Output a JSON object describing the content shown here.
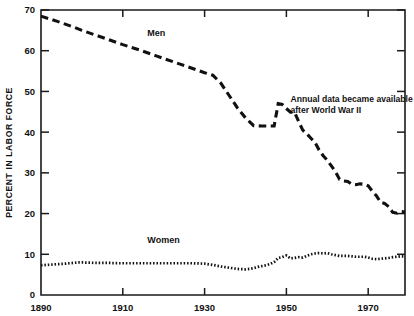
{
  "chart_data": {
    "type": "line",
    "title": "",
    "xlabel": "",
    "ylabel": "PERCENT IN LABOR FORCE",
    "xlim": [
      1890,
      1979
    ],
    "ylim": [
      0,
      70
    ],
    "grid": false,
    "legend_position": "inline-labels",
    "x_ticks": [
      1890,
      1910,
      1930,
      1950,
      1970
    ],
    "x_tick_labels": [
      "1890",
      "1910",
      "1930",
      "1950",
      "1970"
    ],
    "y_ticks": [
      0,
      10,
      20,
      30,
      40,
      50,
      60,
      70
    ],
    "y_tick_labels": [
      "0",
      "10",
      "20",
      "30",
      "40",
      "50",
      "60",
      "70"
    ],
    "annotations": [
      {
        "name": "postwar-note",
        "lines": [
          "Annual data became available",
          "after World War II"
        ],
        "x": 1951,
        "y": 47.5
      }
    ],
    "series": [
      {
        "name": "Men",
        "label": "Men",
        "style": "dashed",
        "color": "#111111",
        "label_x": 1916,
        "label_y": 63.5,
        "x": [
          1890,
          1894,
          1898,
          1900,
          1904,
          1908,
          1910,
          1914,
          1918,
          1920,
          1924,
          1928,
          1930,
          1932,
          1934,
          1936,
          1938,
          1940,
          1942,
          1944,
          1946,
          1947,
          1948,
          1949,
          1950,
          1951,
          1952,
          1953,
          1954,
          1955,
          1956,
          1957,
          1958,
          1959,
          1960,
          1961,
          1962,
          1963,
          1964,
          1965,
          1966,
          1967,
          1968,
          1969,
          1970,
          1971,
          1972,
          1973,
          1974,
          1975,
          1976,
          1977,
          1978,
          1979
        ],
        "y": [
          68.5,
          67.2,
          65.8,
          65.0,
          63.6,
          62.2,
          61.5,
          60.2,
          58.8,
          58.1,
          56.7,
          55.3,
          54.6,
          54.0,
          52.0,
          49.0,
          46.0,
          43.5,
          41.6,
          41.5,
          41.5,
          41.5,
          47.0,
          46.8,
          45.8,
          44.9,
          44.9,
          42.6,
          40.5,
          39.6,
          38.5,
          37.5,
          35.6,
          34.2,
          33.1,
          31.7,
          30.3,
          28.4,
          28.0,
          27.9,
          27.2,
          27.1,
          27.3,
          27.2,
          26.8,
          25.5,
          24.4,
          22.8,
          22.5,
          21.7,
          20.3,
          20.1,
          20.5,
          20.4
        ]
      },
      {
        "name": "Women",
        "label": "Women",
        "style": "dotted",
        "color": "#111111",
        "label_x": 1916,
        "label_y": 12.8,
        "x": [
          1890,
          1893,
          1896,
          1899,
          1900,
          1903,
          1906,
          1909,
          1912,
          1915,
          1918,
          1921,
          1924,
          1927,
          1930,
          1932,
          1934,
          1936,
          1938,
          1940,
          1941,
          1942,
          1943,
          1944,
          1945,
          1946,
          1947,
          1948,
          1949,
          1950,
          1951,
          1952,
          1953,
          1954,
          1955,
          1956,
          1957,
          1958,
          1959,
          1960,
          1961,
          1962,
          1963,
          1964,
          1965,
          1966,
          1967,
          1968,
          1969,
          1970,
          1971,
          1972,
          1973,
          1974,
          1975,
          1976,
          1977,
          1978,
          1979
        ],
        "y": [
          7.3,
          7.5,
          7.7,
          8.0,
          8.0,
          7.9,
          7.9,
          7.8,
          7.8,
          7.8,
          7.8,
          7.8,
          7.8,
          7.8,
          7.7,
          7.4,
          7.0,
          6.7,
          6.4,
          6.3,
          6.4,
          6.6,
          6.9,
          7.1,
          7.3,
          7.6,
          8.1,
          9.1,
          9.3,
          9.7,
          9.0,
          9.1,
          9.3,
          9.2,
          9.6,
          10.0,
          10.2,
          10.3,
          10.2,
          10.3,
          10.0,
          9.8,
          9.6,
          9.6,
          9.6,
          9.5,
          9.4,
          9.4,
          9.4,
          9.2,
          8.9,
          8.8,
          8.9,
          9.0,
          9.1,
          9.3,
          9.4,
          9.5,
          9.5
        ]
      }
    ]
  },
  "plot_geometry": {
    "left": 41,
    "right": 405,
    "top": 10,
    "bottom": 295
  }
}
